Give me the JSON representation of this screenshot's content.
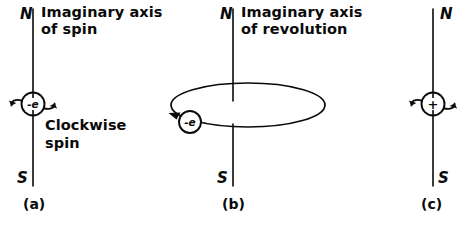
{
  "figure": {
    "background_color": "#ffffff",
    "ink_color": "#0a0a0a"
  },
  "panels": [
    {
      "id": "a",
      "caption": "(a)",
      "north_pole": "N",
      "south_pole": "S",
      "axis_label_line1": "Imaginary axis",
      "axis_label_line2": "of spin",
      "annotation_line1": "Clockwise",
      "annotation_line2": "spin",
      "charge_symbol": "-e",
      "charge_kind": "negative-charge",
      "axis_icon": "vertical-axis-line",
      "spin_arrow_icon": "curved-spin-arrows"
    },
    {
      "id": "b",
      "caption": "(b)",
      "north_pole": "N",
      "south_pole": "S",
      "axis_label_line1": "Imaginary axis",
      "axis_label_line2": "of revolution",
      "charge_symbol": "-e",
      "charge_kind": "negative-charge",
      "orbit_icon": "ellipse-orbit-path",
      "orbit_arrow_icon": "orbit-direction-arrowhead",
      "axis_icon": "vertical-axis-line"
    },
    {
      "id": "c",
      "caption": "(c)",
      "north_pole": "N",
      "south_pole": "S",
      "charge_symbol": "+",
      "charge_kind": "positive-charge",
      "axis_icon": "vertical-axis-line",
      "spin_arrow_icon": "curved-spin-arrows"
    }
  ]
}
